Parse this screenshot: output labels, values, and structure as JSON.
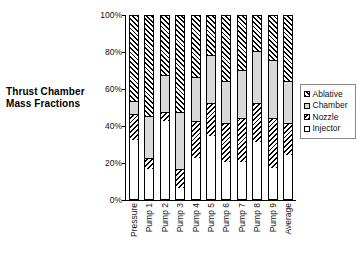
{
  "title": {
    "line1": "Thrust Chamber",
    "line2": "Mass Fractions"
  },
  "legend": {
    "items": [
      {
        "label": "Ablative",
        "swatch": "hatch-forward",
        "color": "#000000"
      },
      {
        "label": "Chamber",
        "swatch": "solid-gray",
        "color": "#d9d9d9"
      },
      {
        "label": "Nozzle",
        "swatch": "hatch-back",
        "color": "#000000"
      },
      {
        "label": "Injector",
        "swatch": "solid-white",
        "color": "#ffffff"
      }
    ]
  },
  "chart_data": {
    "type": "bar",
    "subtype": "stacked-percent",
    "title": "Thrust Chamber Mass Fractions",
    "xlabel": "",
    "ylabel": "",
    "ylim": [
      0,
      100
    ],
    "yticks": [
      "0%",
      "20%",
      "40%",
      "60%",
      "80%",
      "100%"
    ],
    "ytick_values": [
      0,
      20,
      40,
      60,
      80,
      100
    ],
    "grid": false,
    "legend_position": "right",
    "categories": [
      "Pressure",
      "Pump 1",
      "Pump 2",
      "Pump 3",
      "Pump 4",
      "Pump 5",
      "Pump 6",
      "Pump 7",
      "Pump 8",
      "Pump 9",
      "Average"
    ],
    "series": [
      {
        "name": "Injector",
        "pattern": "solid-white",
        "values": [
          32,
          16,
          42,
          6,
          22,
          34,
          20,
          20,
          31,
          17,
          24
        ]
      },
      {
        "name": "Nozzle",
        "pattern": "hatch-back",
        "values": [
          14,
          6,
          5,
          10,
          20,
          18,
          21,
          24,
          21,
          27,
          17
        ]
      },
      {
        "name": "Chamber",
        "pattern": "solid-gray",
        "values": [
          7,
          23,
          20,
          31,
          24,
          26,
          23,
          26,
          28,
          31,
          23
        ]
      },
      {
        "name": "Ablative",
        "pattern": "hatch-forward",
        "values": [
          47,
          55,
          33,
          53,
          34,
          22,
          36,
          30,
          20,
          25,
          36
        ]
      }
    ],
    "stack_order": [
      "Injector",
      "Nozzle",
      "Chamber",
      "Ablative"
    ]
  }
}
